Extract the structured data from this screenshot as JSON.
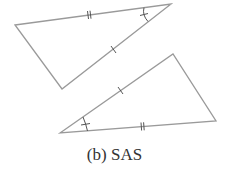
{
  "diagram": {
    "caption": "(b) SAS",
    "stroke_color": "#9a9a9a",
    "mark_color": "#555555",
    "triangles": [
      {
        "name": "top-triangle",
        "vertices": [
          [
            15,
            25
          ],
          [
            171,
            4
          ],
          [
            62,
            89
          ]
        ],
        "marks": {
          "double_tick_side": "top (15,25)-(171,4)",
          "single_tick_side": "right (171,4)-(62,89)",
          "angle_marked_vertex": [
            171,
            4
          ]
        }
      },
      {
        "name": "bottom-triangle",
        "vertices": [
          [
            60,
            133
          ],
          [
            173,
            54
          ],
          [
            216,
            121
          ]
        ],
        "marks": {
          "single_tick_side": "left (60,133)-(173,54)",
          "double_tick_side": "bottom (60,133)-(216,121)",
          "angle_marked_vertex": [
            60,
            133
          ]
        }
      }
    ],
    "congruence_criterion": "SAS"
  }
}
